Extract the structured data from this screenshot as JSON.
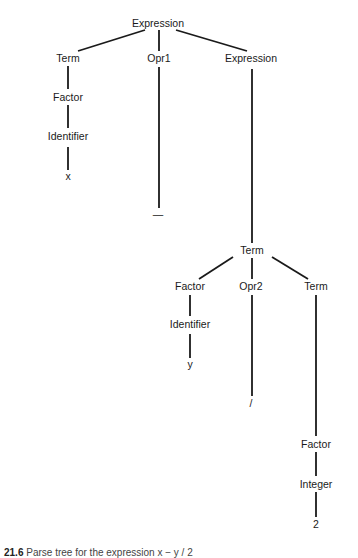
{
  "diagram": {
    "type": "parse-tree",
    "nodes": [
      {
        "id": "n0",
        "label": "Expression",
        "x": 158,
        "y": 23
      },
      {
        "id": "n1",
        "label": "Term",
        "x": 68,
        "y": 58
      },
      {
        "id": "n2",
        "label": "Opr1",
        "x": 159,
        "y": 58
      },
      {
        "id": "n3",
        "label": "Expression",
        "x": 251,
        "y": 58
      },
      {
        "id": "n4",
        "label": "Factor",
        "x": 68,
        "y": 97
      },
      {
        "id": "n5",
        "label": "Identifier",
        "x": 68,
        "y": 136
      },
      {
        "id": "n6",
        "label": "x",
        "x": 68,
        "y": 176
      },
      {
        "id": "n7",
        "label": "—",
        "x": 158,
        "y": 214
      },
      {
        "id": "n8",
        "label": "Term",
        "x": 252,
        "y": 250
      },
      {
        "id": "n9",
        "label": "Factor",
        "x": 190,
        "y": 286
      },
      {
        "id": "n10",
        "label": "Opr2",
        "x": 251,
        "y": 286
      },
      {
        "id": "n11",
        "label": "Term",
        "x": 316,
        "y": 286
      },
      {
        "id": "n12",
        "label": "Identifier",
        "x": 190,
        "y": 324
      },
      {
        "id": "n13",
        "label": "y",
        "x": 190,
        "y": 364
      },
      {
        "id": "n14",
        "label": "/",
        "x": 251,
        "y": 403
      },
      {
        "id": "n15",
        "label": "Factor",
        "x": 316,
        "y": 444
      },
      {
        "id": "n16",
        "label": "Integer",
        "x": 316,
        "y": 484
      },
      {
        "id": "n17",
        "label": "2",
        "x": 316,
        "y": 524
      }
    ],
    "edges": [
      {
        "from": "n0",
        "to": "n1",
        "x1": 145,
        "y1": 30,
        "x2": 78,
        "y2": 51
      },
      {
        "from": "n0",
        "to": "n2",
        "x1": 159,
        "y1": 30,
        "x2": 159,
        "y2": 51
      },
      {
        "from": "n0",
        "to": "n3",
        "x1": 176,
        "y1": 30,
        "x2": 247,
        "y2": 51
      },
      {
        "from": "n1",
        "to": "n4",
        "x1": 68,
        "y1": 66,
        "x2": 68,
        "y2": 89
      },
      {
        "from": "n4",
        "to": "n5",
        "x1": 68,
        "y1": 105,
        "x2": 68,
        "y2": 128
      },
      {
        "from": "n5",
        "to": "n6",
        "x1": 68,
        "y1": 147,
        "x2": 68,
        "y2": 170
      },
      {
        "from": "n2",
        "to": "n7",
        "x1": 159,
        "y1": 67,
        "x2": 159,
        "y2": 208
      },
      {
        "from": "n3",
        "to": "n8",
        "x1": 252,
        "y1": 69,
        "x2": 252,
        "y2": 243
      },
      {
        "from": "n8",
        "to": "n9",
        "x1": 233,
        "y1": 257,
        "x2": 199,
        "y2": 279
      },
      {
        "from": "n8",
        "to": "n10",
        "x1": 252,
        "y1": 258,
        "x2": 252,
        "y2": 279
      },
      {
        "from": "n8",
        "to": "n11",
        "x1": 272,
        "y1": 257,
        "x2": 308,
        "y2": 279
      },
      {
        "from": "n9",
        "to": "n12",
        "x1": 190,
        "y1": 295,
        "x2": 190,
        "y2": 316
      },
      {
        "from": "n12",
        "to": "n13",
        "x1": 190,
        "y1": 334,
        "x2": 190,
        "y2": 358
      },
      {
        "from": "n10",
        "to": "n14",
        "x1": 252,
        "y1": 295,
        "x2": 252,
        "y2": 396
      },
      {
        "from": "n11",
        "to": "n15",
        "x1": 316,
        "y1": 295,
        "x2": 316,
        "y2": 436
      },
      {
        "from": "n15",
        "to": "n16",
        "x1": 316,
        "y1": 452,
        "x2": 316,
        "y2": 476
      },
      {
        "from": "n16",
        "to": "n17",
        "x1": 316,
        "y1": 492,
        "x2": 316,
        "y2": 517
      }
    ],
    "line_color": "#1a1a1a"
  },
  "caption": {
    "prefix": "21.6",
    "text": "Parse tree for the expression x − y / 2"
  }
}
